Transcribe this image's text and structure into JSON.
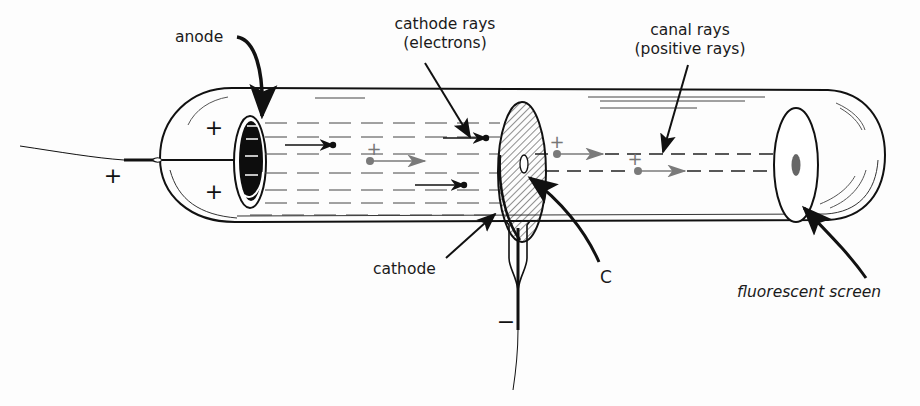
{
  "labels": {
    "anode": "anode",
    "cathode_rays_line1": "cathode rays",
    "cathode_rays_line2": "(electrons)",
    "canal_rays_line1": "canal rays",
    "canal_rays_line2": "(positive rays)",
    "cathode": "cathode",
    "channel": "C",
    "fluorescent_screen": "fluorescent screen"
  },
  "signs": {
    "anode_terminal": "+",
    "anode_upper": "+",
    "anode_lower": "+",
    "cathode_terminal": "−",
    "positive_ion_1": "+",
    "positive_ion_2": "+",
    "positive_ion_3": "+"
  },
  "particles": {
    "electrons": [
      {
        "label": "electron moving toward anode",
        "direction": "left"
      },
      {
        "label": "electron moving toward anode",
        "direction": "left"
      },
      {
        "label": "electron moving toward anode",
        "direction": "left"
      }
    ],
    "positive_ions": [
      {
        "label": "positive ion moving toward cathode",
        "direction": "right"
      },
      {
        "label": "positive ion passing through channel",
        "direction": "right"
      },
      {
        "label": "positive ion toward screen",
        "direction": "right"
      }
    ]
  },
  "colors": {
    "ink": "#111111",
    "ion_gray": "#7a7a7a",
    "screen_spot": "#666666",
    "background": "#fdfdfd"
  }
}
